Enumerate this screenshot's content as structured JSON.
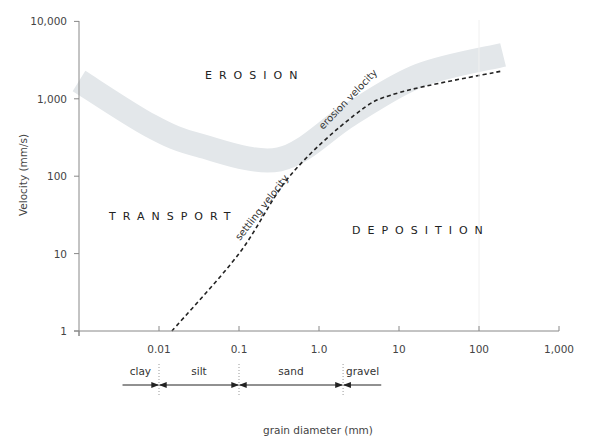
{
  "chart_data": {
    "type": "line",
    "title": "",
    "xlabel": "grain diameter (mm)",
    "ylabel": "Velocity (mm/s)",
    "x_scale": "log",
    "y_scale": "log",
    "xlim": [
      0.001,
      1000
    ],
    "ylim": [
      1,
      10000
    ],
    "grid": false,
    "x_ticks": [
      {
        "value": 0.01,
        "label": "0.01"
      },
      {
        "value": 0.1,
        "label": "0.1"
      },
      {
        "value": 1,
        "label": "1.0"
      },
      {
        "value": 10,
        "label": "10"
      },
      {
        "value": 100,
        "label": "100"
      },
      {
        "value": 1000,
        "label": "1,000"
      }
    ],
    "y_ticks": [
      {
        "value": 1,
        "label": "1"
      },
      {
        "value": 10,
        "label": "10"
      },
      {
        "value": 100,
        "label": "100"
      },
      {
        "value": 1000,
        "label": "1,000"
      },
      {
        "value": 10000,
        "label": "10,000"
      }
    ],
    "series": [
      {
        "name": "erosion velocity",
        "style": "band",
        "color": "#e3e7ea",
        "x": [
          0.001,
          0.0078,
          0.032,
          0.32,
          2.4,
          18,
          200
        ],
        "values": [
          1700,
          450,
          250,
          165,
          620,
          2000,
          3700
        ],
        "band_half_width_log": 0.17
      },
      {
        "name": "settling velocity",
        "style": "dashed",
        "color": "#222222",
        "x": [
          0.0145,
          0.1,
          0.43,
          2.8,
          10,
          200
        ],
        "values": [
          1,
          10,
          100,
          620,
          1200,
          2300
        ]
      }
    ],
    "regions": [
      {
        "label": "EROSION",
        "x": 0.012,
        "y": 1300
      },
      {
        "label": "TRANSPORT",
        "x": 0.0028,
        "y": 28
      },
      {
        "label": "DEPOSITION",
        "x": 3.4,
        "y": 20
      }
    ],
    "grain_classes": [
      {
        "label": "clay",
        "from": 0.0035,
        "to": 0.0098
      },
      {
        "label": "silt",
        "from": 0.0102,
        "to": 0.098
      },
      {
        "label": "sand",
        "from": 0.102,
        "to": 1.95
      },
      {
        "label": "gravel",
        "from": 2.05,
        "to": 6
      }
    ],
    "class_boundaries": [
      0.01,
      0.1,
      2
    ]
  },
  "labels": {
    "erosion": "EROSION",
    "transport": "TRANSPORT",
    "deposition": "DEPOSITION",
    "erosion_curve": "erosion velocity",
    "settling_curve": "settling velocity",
    "xlabel": "grain diameter (mm)",
    "ylabel": "Velocity (mm/s)"
  }
}
